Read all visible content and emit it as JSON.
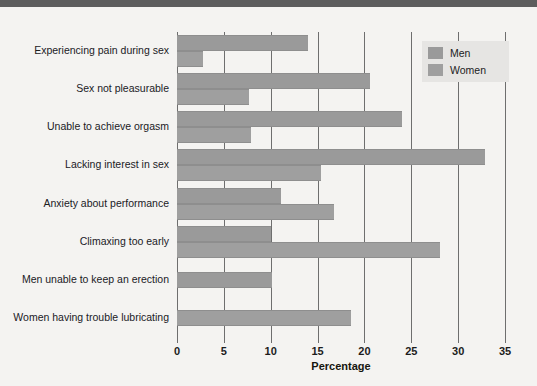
{
  "chart_data": {
    "type": "bar",
    "orientation": "horizontal",
    "title": "",
    "xlabel": "Percentage",
    "ylabel": "",
    "xlim": [
      0,
      35
    ],
    "xticks": [
      0,
      5,
      10,
      15,
      20,
      25,
      30,
      35
    ],
    "grid": true,
    "legend_position": "top-right",
    "categories": [
      "Experiencing pain during sex",
      "Sex not pleasurable",
      "Unable to achieve orgasm",
      "Lacking interest in sex",
      "Anxiety about performance",
      "Climaxing too early",
      "Men unable to keep an erection",
      "Women having trouble lubricating"
    ],
    "series": [
      {
        "name": "Men",
        "color": "#9a9a9a",
        "values": [
          14.0,
          20.6,
          24.0,
          32.9,
          11.1,
          10.0,
          10.1,
          null
        ]
      },
      {
        "name": "Women",
        "color": "#9f9f9f",
        "values": [
          2.8,
          7.7,
          7.9,
          15.4,
          16.8,
          28.1,
          null,
          18.6
        ]
      }
    ]
  },
  "legend": {
    "items": [
      {
        "label": "Men",
        "color": "#9a9a9a"
      },
      {
        "label": "Women",
        "color": "#9f9f9f"
      }
    ]
  },
  "axis": {
    "title": "Percentage",
    "tick_labels": [
      "0",
      "5",
      "10",
      "15",
      "20",
      "25",
      "30",
      "35"
    ]
  },
  "colors": {
    "page_background": "#f4f3f1",
    "top_band": "#5d5d5d",
    "bar_fill": "#9a9a9a",
    "gridline": "#6e6e6e",
    "text": "#20201f",
    "legend_background": "#e6e5e3"
  }
}
